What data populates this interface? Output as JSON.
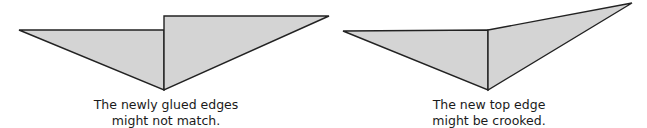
{
  "figures": [
    {
      "id": "mismatched-edges",
      "caption": [
        "The newly glued edges",
        "might not match."
      ],
      "fill": "#d4d4d4",
      "stroke": "#222222"
    },
    {
      "id": "crooked-top-edge",
      "caption": [
        "The new top edge",
        "might be crooked."
      ],
      "fill": "#d4d4d4",
      "stroke": "#222222"
    }
  ]
}
